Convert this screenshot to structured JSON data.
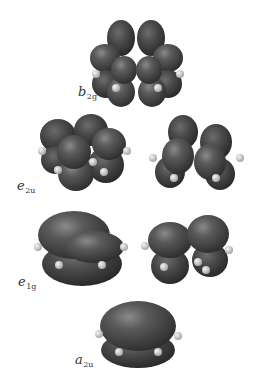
{
  "figure": {
    "colors": {
      "lobe_dark": "#3a3a3a",
      "lobe_mid": "#5a5a5a",
      "lobe_highlight": "#8a8a8a",
      "hydrogen": "#d8d8d8",
      "background": "#ffffff",
      "label": "#333333"
    },
    "orbitals": [
      {
        "label_main": "b",
        "label_sub": "2g",
        "count": 1
      },
      {
        "label_main": "e",
        "label_sub": "2u",
        "count": 2
      },
      {
        "label_main": "e",
        "label_sub": "1g",
        "count": 2
      },
      {
        "label_main": "a",
        "label_sub": "2u",
        "count": 1
      }
    ]
  }
}
